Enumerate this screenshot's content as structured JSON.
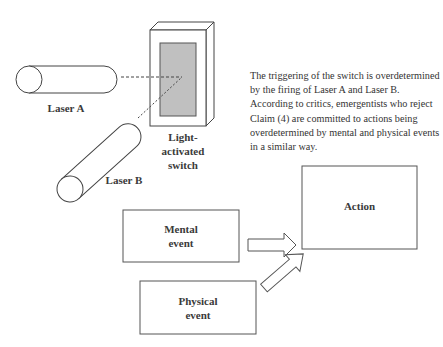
{
  "figure": {
    "caption": "The triggering of the switch is overdetermined by the firing of Laser A and Laser B. According to critics, emergentists who reject Claim (4) are committed to actions being overdetermined by mental and physical events in a similar way.",
    "lasers": [
      {
        "label": "Laser A"
      },
      {
        "label": "Laser B"
      }
    ],
    "switch": {
      "label_line1": "Light-",
      "label_line2": "activated",
      "label_line3": "switch"
    },
    "boxes": {
      "mental": {
        "line1": "Mental",
        "line2": "event"
      },
      "physical": {
        "line1": "Physical",
        "line2": "event"
      },
      "action": {
        "label": "Action"
      }
    },
    "colors": {
      "stroke": "#444444",
      "shade": "#bdbdbd",
      "background": "#ffffff"
    }
  }
}
